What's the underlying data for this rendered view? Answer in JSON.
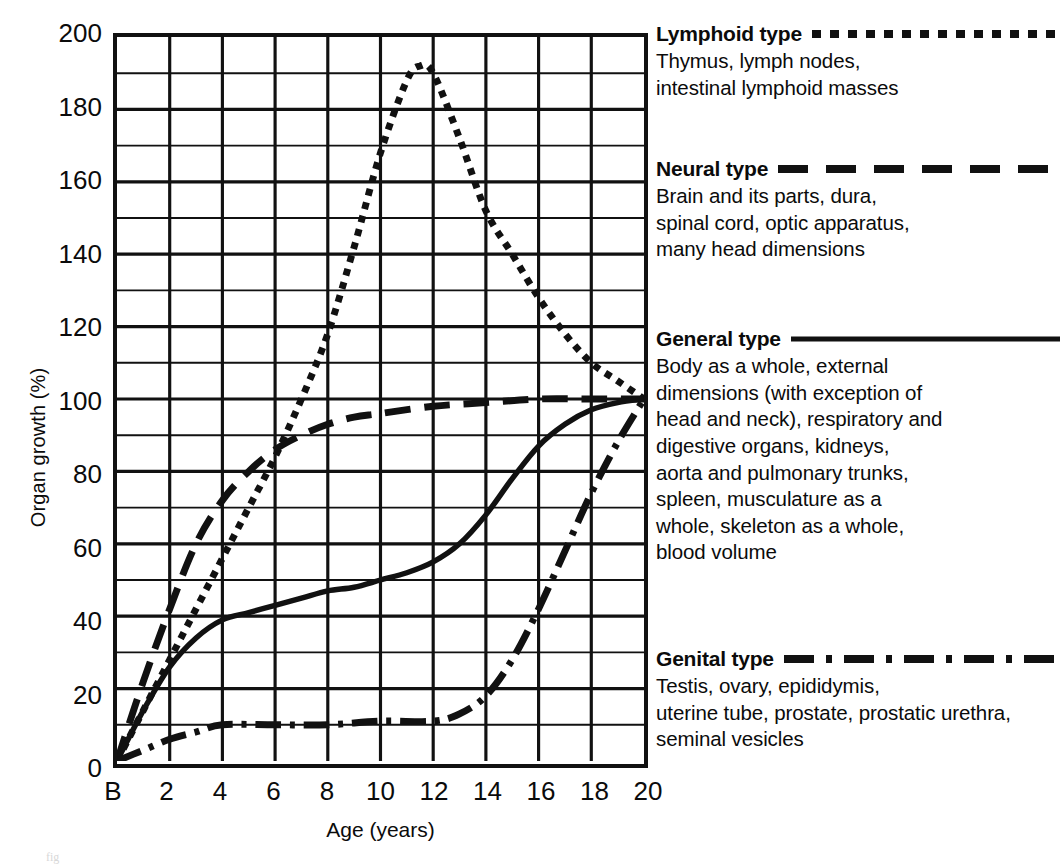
{
  "chart_data": {
    "type": "line",
    "title": "",
    "xlabel": "Age (years)",
    "ylabel": "Organ growth (%)",
    "xlim": [
      0,
      20
    ],
    "ylim": [
      0,
      200
    ],
    "xticks": [
      "B",
      "2",
      "4",
      "6",
      "8",
      "10",
      "12",
      "14",
      "16",
      "18",
      "20"
    ],
    "xtick_values": [
      0,
      2,
      4,
      6,
      8,
      10,
      12,
      14,
      16,
      18,
      20
    ],
    "yticks": [
      "0",
      "20",
      "40",
      "60",
      "80",
      "100",
      "120",
      "140",
      "160",
      "180",
      "200"
    ],
    "ytick_values": [
      0,
      20,
      40,
      60,
      80,
      100,
      120,
      140,
      160,
      180,
      200
    ],
    "grid": "major and minor gridlines; major every 2 years (x) and 20% (y), minor every 10% (y)",
    "legend_position": "right",
    "series": [
      {
        "name": "Lymphoid type",
        "style": "dotted",
        "x": [
          0,
          1,
          2,
          3,
          4,
          5,
          6,
          7,
          8,
          9,
          10,
          11,
          11.5,
          12,
          13,
          14,
          15,
          16,
          17,
          18,
          19,
          20
        ],
        "values": [
          0,
          14,
          28,
          42,
          56,
          70,
          84,
          100,
          118,
          142,
          168,
          188,
          192,
          190,
          172,
          152,
          140,
          128,
          118,
          110,
          105,
          100
        ]
      },
      {
        "name": "Neural type",
        "style": "dashed",
        "x": [
          0,
          1,
          2,
          3,
          4,
          5,
          6,
          7,
          8,
          9,
          10,
          12,
          14,
          16,
          18,
          20
        ],
        "values": [
          0,
          22,
          42,
          60,
          72,
          80,
          86,
          90,
          93,
          95,
          96,
          98,
          99,
          100,
          100,
          100
        ]
      },
      {
        "name": "General type",
        "style": "solid",
        "x": [
          0,
          1,
          2,
          3,
          4,
          5,
          6,
          7,
          8,
          9,
          10,
          11,
          12,
          13,
          14,
          15,
          16,
          17,
          18,
          19,
          20
        ],
        "values": [
          0,
          14,
          26,
          34,
          39,
          41,
          43,
          45,
          47,
          48,
          50,
          52,
          55,
          60,
          68,
          78,
          87,
          93,
          97,
          99,
          100
        ]
      },
      {
        "name": "Genital type",
        "style": "dash-dot",
        "x": [
          0,
          1,
          2,
          3,
          4,
          6,
          8,
          10,
          12,
          13,
          14,
          15,
          16,
          17,
          18,
          19,
          20
        ],
        "values": [
          0,
          3,
          6,
          8,
          10,
          10,
          10,
          11,
          11,
          13,
          18,
          28,
          42,
          58,
          74,
          88,
          100
        ]
      }
    ]
  },
  "legend": [
    {
      "title": "Lymphoid type",
      "style": "dotted",
      "lines": [
        "Thymus, lymph nodes,",
        "intestinal lymphoid masses"
      ]
    },
    {
      "title": "Neural type",
      "style": "dashed",
      "lines": [
        "Brain and its parts, dura,",
        "spinal cord, optic apparatus,",
        "many head dimensions"
      ]
    },
    {
      "title": "General type",
      "style": "solid",
      "lines": [
        "Body as a whole, external",
        "dimensions (with exception of",
        "head and neck), respiratory and",
        "digestive organs, kidneys,",
        "aorta and pulmonary trunks,",
        "spleen, musculature as a",
        "whole, skeleton as a whole,",
        "blood volume"
      ]
    },
    {
      "title": "Genital type",
      "style": "dash-dot",
      "lines": [
        "Testis, ovary, epididymis,",
        "uterine tube, prostate, prostatic urethra,",
        "seminal vesicles"
      ]
    }
  ],
  "colors": {
    "ink": "#111111",
    "background": "#ffffff"
  }
}
